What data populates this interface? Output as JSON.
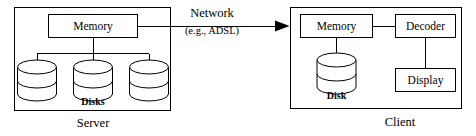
{
  "diagram": {
    "server": {
      "group_label": "Server",
      "memory_label": "Memory",
      "disks_label": "Disks",
      "disk_count": 3
    },
    "network": {
      "label": "Network",
      "sublabel": "(e.g., ADSL)",
      "direction": "server-to-client"
    },
    "client": {
      "group_label": "Client",
      "memory_label": "Memory",
      "disk_label": "Disk",
      "decoder_label": "Decoder",
      "display_label": "Display"
    },
    "colors": {
      "stroke": "#000000",
      "background": "#ffffff",
      "text": "#000000"
    }
  }
}
